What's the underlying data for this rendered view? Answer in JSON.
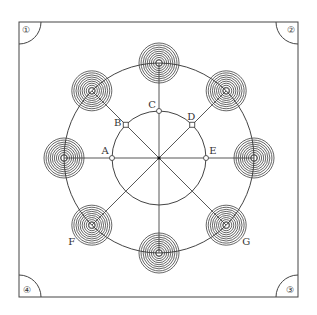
{
  "figure": {
    "colors": {
      "line": "#444444",
      "coil": "#555555",
      "background": "#ffffff"
    },
    "frame": {
      "x": 19,
      "y": 22,
      "width": 279,
      "height": 275
    },
    "center": {
      "x": 159,
      "y": 158
    },
    "inner_circle_radius": 47,
    "outer_circle_radius": 95,
    "coil_rings": 9,
    "coil_outer_radius": 20,
    "corner_labels": [
      "①",
      "②",
      "③",
      "④"
    ],
    "inner_points": [
      {
        "label": "A",
        "angle_deg": 180,
        "marker": "circle"
      },
      {
        "label": "B",
        "angle_deg": 135,
        "marker": "square"
      },
      {
        "label": "C",
        "angle_deg": 90,
        "marker": "circle"
      },
      {
        "label": "D",
        "angle_deg": 45,
        "marker": "square"
      },
      {
        "label": "E",
        "angle_deg": 0,
        "marker": "circle"
      }
    ],
    "coils": [
      {
        "id": "top",
        "angle_deg": 90,
        "label": ""
      },
      {
        "id": "upper-right",
        "angle_deg": 45,
        "label": ""
      },
      {
        "id": "right",
        "angle_deg": 0,
        "label": ""
      },
      {
        "id": "lower-right",
        "angle_deg": -45,
        "label": "G"
      },
      {
        "id": "bottom",
        "angle_deg": -90,
        "label": ""
      },
      {
        "id": "lower-left",
        "angle_deg": -135,
        "label": "F"
      },
      {
        "id": "left",
        "angle_deg": 180,
        "label": ""
      },
      {
        "id": "upper-left",
        "angle_deg": 135,
        "label": ""
      }
    ]
  }
}
